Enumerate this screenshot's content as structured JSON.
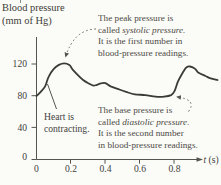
{
  "axis": {
    "ylabel_line1": "Blood pressure",
    "ylabel_line2": "(mm of Hg)",
    "xlabel_var": "t",
    "xlabel_unit": " (s)",
    "y_ticks": [
      "120",
      "80",
      "40",
      "0"
    ],
    "x_ticks": [
      "0",
      "0.2",
      "0.4",
      "0.6",
      "0.8"
    ]
  },
  "notes": {
    "peak": {
      "l1": "The peak pressure is",
      "l2a": "called ",
      "l2b": "systolic pressure.",
      "l3": "It is the first number in",
      "l4": "blood-pressure readings."
    },
    "base": {
      "l1": "The base pressure is",
      "l2a": "called ",
      "l2b": "diastolic pressure.",
      "l3": "It is the second number",
      "l4": "in blood-pressure readings."
    },
    "heart": {
      "l1": "Heart is",
      "l2": "contracting."
    }
  },
  "chart_data": {
    "type": "line",
    "title": "",
    "xlabel": "t (s)",
    "ylabel": "Blood pressure (mm of Hg)",
    "xlim": [
      0,
      1.08
    ],
    "ylim": [
      0,
      150
    ],
    "x_ticks": [
      0,
      0.2,
      0.4,
      0.6,
      0.8
    ],
    "y_ticks": [
      0,
      40,
      80,
      120
    ],
    "grid": false,
    "series": [
      {
        "name": "blood-pressure-curve",
        "points": [
          [
            0.0,
            80
          ],
          [
            0.02,
            84
          ],
          [
            0.05,
            92
          ],
          [
            0.07,
            104
          ],
          [
            0.1,
            114
          ],
          [
            0.13,
            119
          ],
          [
            0.16,
            121
          ],
          [
            0.19,
            119
          ],
          [
            0.21,
            113
          ],
          [
            0.24,
            106
          ],
          [
            0.27,
            100
          ],
          [
            0.3,
            96
          ],
          [
            0.33,
            93
          ],
          [
            0.35,
            94
          ],
          [
            0.38,
            96
          ],
          [
            0.4,
            96
          ],
          [
            0.43,
            92
          ],
          [
            0.48,
            88
          ],
          [
            0.52,
            85
          ],
          [
            0.57,
            82
          ],
          [
            0.63,
            81
          ],
          [
            0.69,
            79
          ],
          [
            0.74,
            79
          ],
          [
            0.78,
            81
          ],
          [
            0.8,
            86
          ],
          [
            0.82,
            98
          ],
          [
            0.85,
            110
          ],
          [
            0.87,
            116
          ],
          [
            0.89,
            117
          ],
          [
            0.92,
            114
          ],
          [
            0.94,
            109
          ],
          [
            0.98,
            105
          ],
          [
            1.01,
            102
          ],
          [
            1.05,
            100
          ]
        ]
      }
    ],
    "annotations": [
      {
        "text": "The peak pressure is called systolic pressure. It is the first number in blood-pressure readings.",
        "points_to": "first peak, about 120 mm Hg at t = 0.16 s"
      },
      {
        "text": "The base pressure is called diastolic pressure. It is the second number in blood-pressure readings.",
        "points_to": "curve base, about 80 mm Hg at t = 0.78 s"
      },
      {
        "text": "Heart is contracting.",
        "points_to": "steep rising edge near t = 0.05 s"
      }
    ]
  }
}
